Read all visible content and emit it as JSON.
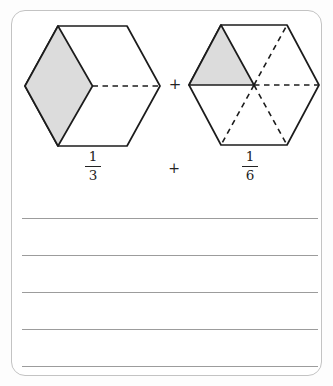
{
  "figure": {
    "plus_operator": "+",
    "left_hexagon": {
      "description": "hexagon-divided-into-thirds-one-shaded",
      "shaded_parts": 1,
      "total_parts": 3
    },
    "right_hexagon": {
      "description": "hexagon-divided-into-sixths-one-shaded",
      "shaded_parts": 1,
      "total_parts": 6
    }
  },
  "expression": {
    "left_fraction": {
      "numerator": "1",
      "denominator": "3"
    },
    "operator": "+",
    "right_fraction": {
      "numerator": "1",
      "denominator": "6"
    }
  },
  "answer_area": {
    "line_count": 5
  },
  "colors": {
    "card_border": "#c3c3c3",
    "card_background": "#ffffff",
    "page_background": "#fdfdfd",
    "outline": "#1c1c1c",
    "shade": "#dcdcdc",
    "rule_line": "#9c9c9c"
  }
}
